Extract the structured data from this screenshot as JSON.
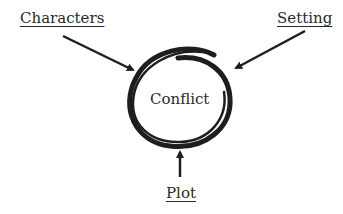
{
  "diagram": {
    "center": {
      "label": "Conflict"
    },
    "nodes": [
      {
        "id": "characters",
        "label": "Characters",
        "points_to": "conflict"
      },
      {
        "id": "setting",
        "label": "Setting",
        "points_to": "conflict"
      },
      {
        "id": "plot",
        "label": "Plot",
        "points_to": "conflict"
      }
    ],
    "colors": {
      "ink": "#1e1e1e",
      "text": "#2a2a2a",
      "background": "#ffffff"
    }
  }
}
